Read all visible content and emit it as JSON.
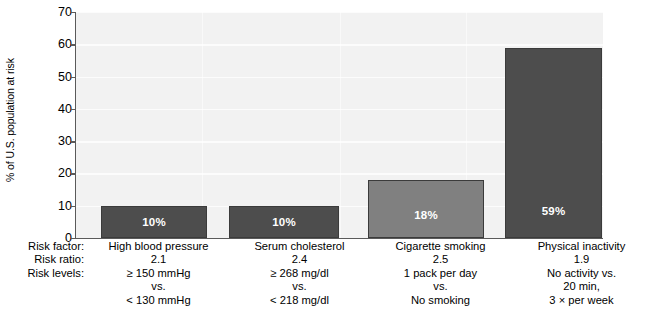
{
  "chart_data": {
    "type": "bar",
    "title": "",
    "xlabel": "",
    "ylabel": "% of U.S. population at risk",
    "ylim": [
      0,
      70
    ],
    "yticks": [
      0,
      10,
      20,
      30,
      40,
      50,
      60,
      70
    ],
    "grid": true,
    "legend": "none",
    "categories": [
      "High blood pressure",
      "Serum cholesterol",
      "Cigarette smoking",
      "Physical inactivity"
    ],
    "values": [
      10,
      10,
      18,
      59
    ],
    "value_labels": [
      "10%",
      "10%",
      "18%",
      "59%"
    ],
    "bar_colors": [
      "#4d4d4d",
      "#4d4d4d",
      "#808080",
      "#4d4d4d"
    ],
    "series": [
      {
        "name": "% of U.S. population at risk",
        "values": [
          10,
          10,
          18,
          59
        ]
      }
    ],
    "annotations": {
      "risk_ratio": [
        2.1,
        2.4,
        2.5,
        1.9
      ]
    }
  },
  "axis": {
    "y_title": "% of U.S. population at risk",
    "y_ticks": [
      "70",
      "60",
      "50",
      "40",
      "30",
      "20",
      "10",
      "0"
    ]
  },
  "table": {
    "rows": [
      {
        "label": "Risk factor:",
        "cells": [
          "High blood pressure",
          "Serum cholesterol",
          "Cigarette smoking",
          "Physical inactivity"
        ]
      },
      {
        "label": "Risk ratio:",
        "cells": [
          "2.1",
          "2.4",
          "2.5",
          "1.9"
        ]
      },
      {
        "label": "Risk levels:",
        "cells": [
          "≥ 150 mmHg",
          "≥ 268 mg/dl",
          "1 pack per day",
          "No activity vs."
        ]
      },
      {
        "label": "",
        "cells": [
          "vs.",
          "vs.",
          "vs.",
          "20 min,"
        ]
      },
      {
        "label": "",
        "cells": [
          "< 130 mmHg",
          "< 218 mg/dl",
          "No smoking",
          "3 × per week"
        ]
      }
    ]
  },
  "bars": [
    {
      "label": "10%",
      "value": 10,
      "color": "#4d4d4d",
      "left": 100,
      "width": 106
    },
    {
      "label": "10%",
      "value": 10,
      "color": "#4d4d4d",
      "left": 228,
      "width": 110
    },
    {
      "label": "18%",
      "value": 18,
      "color": "#808080",
      "left": 367,
      "width": 116
    },
    {
      "label": "59%",
      "value": 59,
      "color": "#4d4d4d",
      "left": 504,
      "width": 97
    }
  ]
}
